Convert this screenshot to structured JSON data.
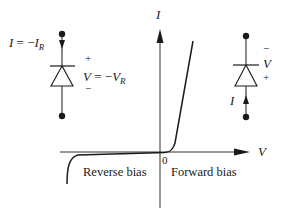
{
  "diagram": {
    "type": "diode I-V characteristic",
    "axes": {
      "x_label": "V",
      "y_label": "I",
      "origin_label": "0"
    },
    "regions": {
      "reverse": "Reverse bias",
      "forward": "Forward bias"
    },
    "left_circuit": {
      "current_label_I": "I",
      "current_label_eq": " = −",
      "current_label_IR": "I",
      "current_label_IR_sub": "R",
      "plus": "+",
      "minus": "−",
      "voltage_label_V": "V",
      "voltage_label_eq": " = −",
      "voltage_label_VR": "V",
      "voltage_label_VR_sub": "R"
    },
    "right_circuit": {
      "current_label": "I",
      "minus": "−",
      "voltage_label": "V",
      "plus": "+"
    },
    "colors": {
      "ink": "#1a1a1a",
      "background": "#ffffff"
    }
  }
}
